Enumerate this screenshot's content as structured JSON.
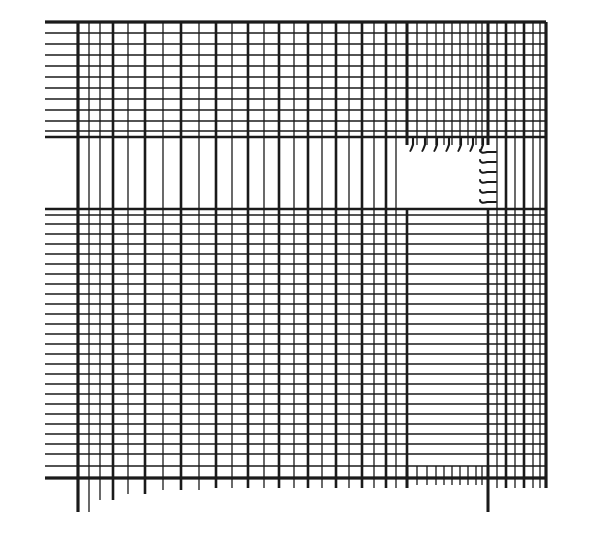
{
  "figure": {
    "type": "engineering-mesh-drawing",
    "style": "scanned line drawing, black ink on white paper",
    "canvas": {
      "width": 613,
      "height": 536
    },
    "colors": {
      "background": "#ffffff",
      "ink": "#1a1a1a"
    }
  },
  "chart_data": {
    "type": "mesh",
    "xlabel": "",
    "ylabel": "",
    "xlim": [
      45,
      546
    ],
    "ylim": [
      22,
      478
    ],
    "grid": true,
    "legend": null,
    "domain": {
      "left": 45,
      "right": 546,
      "top": 22,
      "bottom": 478,
      "grid_left": 78,
      "grid_bottom": 478
    },
    "void_rect": {
      "label": "rectangular void / notch",
      "x0": 407,
      "y0": 145,
      "x1": 488,
      "y1": 209
    },
    "blank_band_horizontal": {
      "label": "band with no horizontal lines (left of void)",
      "y0": 145,
      "y1": 209,
      "x0": 78,
      "x1": 407
    },
    "blank_band_vertical": {
      "label": "band with no vertical lines (below void)",
      "x0": 407,
      "y0": 209,
      "x1": 488,
      "y1": 466
    },
    "vertical_lines_x": [
      78,
      89,
      100,
      113,
      128,
      145,
      163,
      181,
      199,
      216,
      232,
      248,
      264,
      279,
      294,
      308,
      322,
      336,
      349,
      362,
      374,
      386,
      396,
      407,
      417,
      427,
      436,
      444,
      452,
      460,
      468,
      476,
      482,
      488,
      497,
      506,
      515,
      524,
      533,
      540,
      546
    ],
    "vertical_lines_weight": [
      2.6,
      1.3,
      1.3,
      2.6,
      1.3,
      2.6,
      1.3,
      2.6,
      1.3,
      2.6,
      1.3,
      2.6,
      1.3,
      2.6,
      1.3,
      2.6,
      1.3,
      2.6,
      1.3,
      2.6,
      1.3,
      2.6,
      1.3,
      2.6,
      1.3,
      1.3,
      1.3,
      1.3,
      1.3,
      1.3,
      1.3,
      1.3,
      1.3,
      2.6,
      1.3,
      2.6,
      1.3,
      2.6,
      1.3,
      1.3,
      2.6
    ],
    "vertical_lines_bottom_overshoot": [
      34,
      34,
      22,
      22,
      16,
      16,
      12,
      12,
      12,
      10,
      10,
      10,
      10,
      10,
      10,
      10,
      10,
      10,
      10,
      10,
      10,
      10,
      10,
      10,
      7,
      7,
      7,
      7,
      7,
      7,
      7,
      7,
      7,
      34,
      10,
      10,
      10,
      10,
      10,
      10,
      10
    ],
    "horizontal_lines_y": [
      22,
      33,
      44,
      55,
      66,
      77,
      88,
      99,
      110,
      121,
      131,
      137,
      209,
      215,
      224,
      234,
      244,
      254,
      264,
      274,
      284,
      294,
      304,
      314,
      324,
      334,
      344,
      354,
      364,
      374,
      384,
      394,
      404,
      414,
      424,
      434,
      444,
      454,
      466,
      478
    ],
    "horizontal_lines_weight": [
      2.6,
      1.3,
      1.3,
      1.3,
      1.3,
      1.3,
      1.3,
      1.3,
      1.3,
      1.3,
      1.3,
      2.6,
      2.6,
      1.3,
      1.3,
      1.3,
      1.3,
      1.3,
      1.3,
      1.3,
      1.3,
      1.3,
      1.3,
      1.3,
      1.3,
      1.3,
      1.3,
      1.3,
      1.3,
      1.3,
      1.3,
      1.3,
      1.3,
      1.3,
      1.3,
      1.3,
      1.3,
      1.3,
      1.3,
      2.6
    ],
    "horizontal_lines_left_overshoot": [
      33,
      33,
      33,
      33,
      33,
      33,
      33,
      33,
      33,
      33,
      33,
      33,
      33,
      33,
      33,
      33,
      33,
      33,
      33,
      33,
      33,
      33,
      33,
      33,
      33,
      33,
      33,
      33,
      33,
      33,
      33,
      33,
      33,
      33,
      33,
      33,
      33,
      33,
      33,
      33
    ],
    "void_top_hooks_x": [
      413,
      425,
      437,
      449,
      461,
      473,
      483
    ],
    "void_right_hooks_y": [
      152,
      162,
      172,
      182,
      192,
      202
    ],
    "notes": [
      "Graded quadrilateral mesh: coarse spacing at upper-left, refined toward the right and lower edges.",
      "A rectangular void is cut out of the mesh at upper-right; element edges terminate in short hooked stubs along its top and right boundaries.",
      "Horizontal mesh lines overshoot the leftmost vertical line; vertical mesh lines overshoot the bottom horizontal line."
    ]
  }
}
